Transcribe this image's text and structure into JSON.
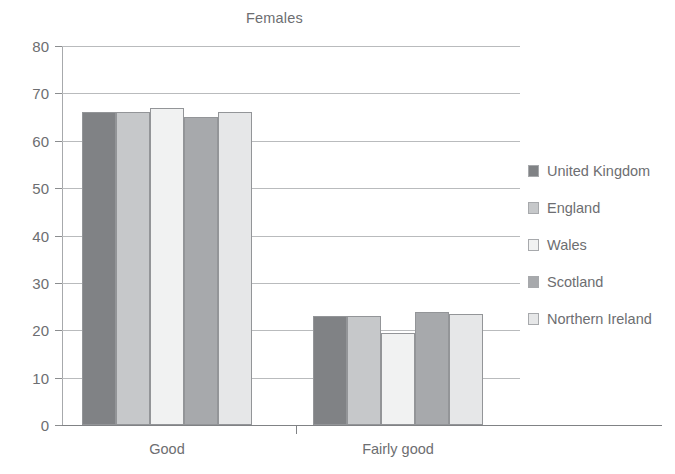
{
  "chart_data": {
    "type": "bar",
    "title": "Females",
    "xlabel": "",
    "ylabel": "",
    "ylim": [
      0,
      80
    ],
    "ytick_step": 10,
    "yticks": [
      80,
      70,
      60,
      50,
      40,
      30,
      20,
      10,
      0
    ],
    "grid": true,
    "legend_position": "right",
    "categories": [
      "Good",
      "Fairly good"
    ],
    "series": [
      {
        "name": "United Kingdom",
        "color": "#808285",
        "values": [
          66.0,
          23.0
        ]
      },
      {
        "name": "England",
        "color": "#c6c8ca",
        "values": [
          66.0,
          23.0
        ]
      },
      {
        "name": "Wales",
        "color": "#f1f2f2",
        "values": [
          67.0,
          19.5
        ]
      },
      {
        "name": "Scotland",
        "color": "#a7a9ac",
        "values": [
          65.0,
          23.8
        ]
      },
      {
        "name": "Northern Ireland",
        "color": "#e6e7e8",
        "values": [
          66.0,
          23.5
        ]
      }
    ]
  }
}
